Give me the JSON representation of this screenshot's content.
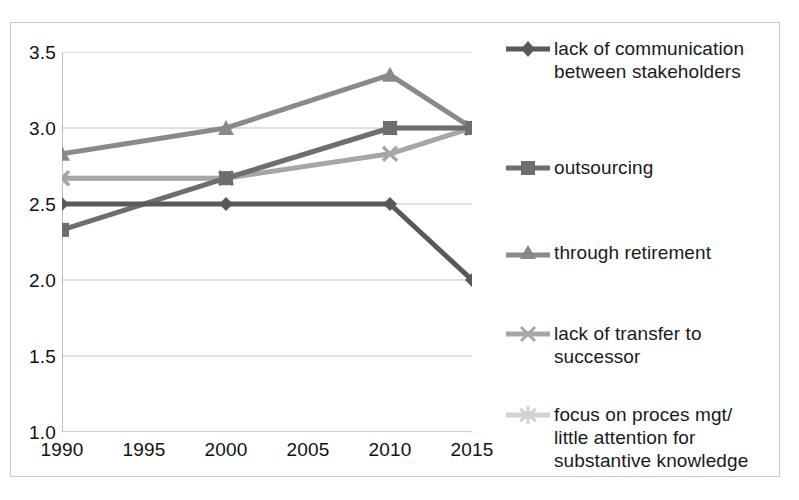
{
  "chart_data": {
    "type": "line",
    "title": "",
    "xlabel": "",
    "ylabel": "",
    "x": [
      1990,
      2000,
      2010,
      2015
    ],
    "x_ticks": [
      "1990",
      "1995",
      "2000",
      "2005",
      "2010",
      "2015"
    ],
    "x_tick_values": [
      1990,
      1995,
      2000,
      2005,
      2010,
      2015
    ],
    "xlim": [
      1990,
      2015
    ],
    "y_ticks": [
      "1.0",
      "1.5",
      "2.0",
      "2.5",
      "3.0",
      "3.5"
    ],
    "y_tick_values": [
      1.0,
      1.5,
      2.0,
      2.5,
      3.0,
      3.5
    ],
    "ylim": [
      1.0,
      3.5
    ],
    "grid": "horizontal",
    "legend_position": "right",
    "series": [
      {
        "name": "lack of communication between stakeholders",
        "label_lines": [
          "lack of communication",
          "between stakeholders"
        ],
        "marker": "diamond",
        "color": "#595959",
        "values": [
          2.5,
          2.5,
          2.5,
          2.0
        ]
      },
      {
        "name": "outsourcing",
        "label_lines": [
          "outsourcing"
        ],
        "marker": "square",
        "color": "#6e6e6e",
        "values": [
          2.33,
          2.67,
          3.0,
          3.0
        ]
      },
      {
        "name": "through retirement",
        "label_lines": [
          "through retirement"
        ],
        "marker": "triangle",
        "color": "#8a8a8a",
        "values": [
          2.83,
          3.0,
          3.35,
          3.0
        ]
      },
      {
        "name": "lack of transfer to successor",
        "label_lines": [
          "lack of transfer to",
          "successor"
        ],
        "marker": "cross-x",
        "color": "#a6a6a6",
        "values": [
          2.67,
          2.67,
          2.83,
          3.0
        ]
      },
      {
        "name": "focus on proces mgt/ little attention for substantive knowledge",
        "label_lines": [
          "focus on proces mgt/",
          "little attention for",
          "substantive knowledge"
        ],
        "marker": "asterisk",
        "color": "#d2d2d2",
        "values": [
          2.67,
          2.67,
          3.0,
          3.0
        ]
      }
    ]
  },
  "axes": {
    "y_labels": [
      "3.5",
      "3.0",
      "2.5",
      "2.0",
      "1.5",
      "1.0"
    ],
    "x_labels": [
      "1990",
      "1995",
      "2000",
      "2005",
      "2010",
      "2015"
    ]
  },
  "legend": {
    "entries": [
      {
        "line1": "lack of communication",
        "line2": "between stakeholders",
        "line3": ""
      },
      {
        "line1": "outsourcing",
        "line2": "",
        "line3": ""
      },
      {
        "line1": "through retirement",
        "line2": "",
        "line3": ""
      },
      {
        "line1": "lack of transfer to",
        "line2": "successor",
        "line3": ""
      },
      {
        "line1": "focus on proces mgt/",
        "line2": "little attention for",
        "line3": "substantive knowledge"
      }
    ]
  },
  "colors": {
    "frame": "#c9c9c9",
    "gridline": "#bfbfbf",
    "axis": "#9a9a9a",
    "text": "#1a1a1a",
    "series_1": "#595959",
    "series_2": "#6e6e6e",
    "series_3": "#8a8a8a",
    "series_4": "#a6a6a6",
    "series_5": "#d2d2d2"
  }
}
